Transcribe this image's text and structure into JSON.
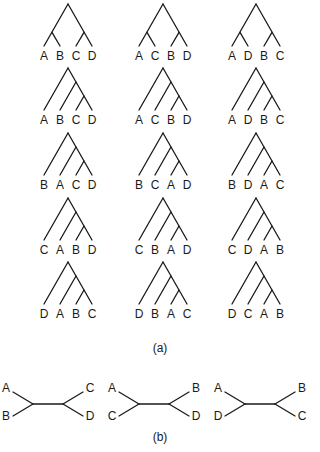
{
  "figure": {
    "panel_a": {
      "caption": "(a)",
      "description": "15 rooted binary trees for four taxa A, B, C, D",
      "trees": [
        {
          "shape": "balanced",
          "leaves": [
            "A",
            "B",
            "C",
            "D"
          ]
        },
        {
          "shape": "balanced",
          "leaves": [
            "A",
            "C",
            "B",
            "D"
          ]
        },
        {
          "shape": "balanced",
          "leaves": [
            "A",
            "D",
            "B",
            "C"
          ]
        },
        {
          "shape": "pectinate",
          "leaves": [
            "A",
            "B",
            "C",
            "D"
          ]
        },
        {
          "shape": "pectinate",
          "leaves": [
            "A",
            "C",
            "B",
            "D"
          ]
        },
        {
          "shape": "pectinate",
          "leaves": [
            "A",
            "D",
            "B",
            "C"
          ]
        },
        {
          "shape": "pectinate",
          "leaves": [
            "B",
            "A",
            "C",
            "D"
          ]
        },
        {
          "shape": "pectinate",
          "leaves": [
            "B",
            "C",
            "A",
            "D"
          ]
        },
        {
          "shape": "pectinate",
          "leaves": [
            "B",
            "D",
            "A",
            "C"
          ]
        },
        {
          "shape": "pectinate",
          "leaves": [
            "C",
            "A",
            "B",
            "D"
          ]
        },
        {
          "shape": "pectinate",
          "leaves": [
            "C",
            "B",
            "A",
            "D"
          ]
        },
        {
          "shape": "pectinate",
          "leaves": [
            "C",
            "D",
            "A",
            "B"
          ]
        },
        {
          "shape": "pectinate",
          "leaves": [
            "D",
            "A",
            "B",
            "C"
          ]
        },
        {
          "shape": "pectinate",
          "leaves": [
            "D",
            "B",
            "A",
            "C"
          ]
        },
        {
          "shape": "pectinate",
          "leaves": [
            "D",
            "C",
            "A",
            "B"
          ]
        }
      ]
    },
    "panel_b": {
      "caption": "(b)",
      "description": "3 unrooted binary trees for four taxa",
      "trees": [
        {
          "left": [
            "A",
            "B"
          ],
          "right": [
            "C",
            "D"
          ]
        },
        {
          "left": [
            "A",
            "C"
          ],
          "right": [
            "B",
            "D"
          ]
        },
        {
          "left": [
            "A",
            "D"
          ],
          "right": [
            "B",
            "C"
          ]
        }
      ]
    }
  }
}
